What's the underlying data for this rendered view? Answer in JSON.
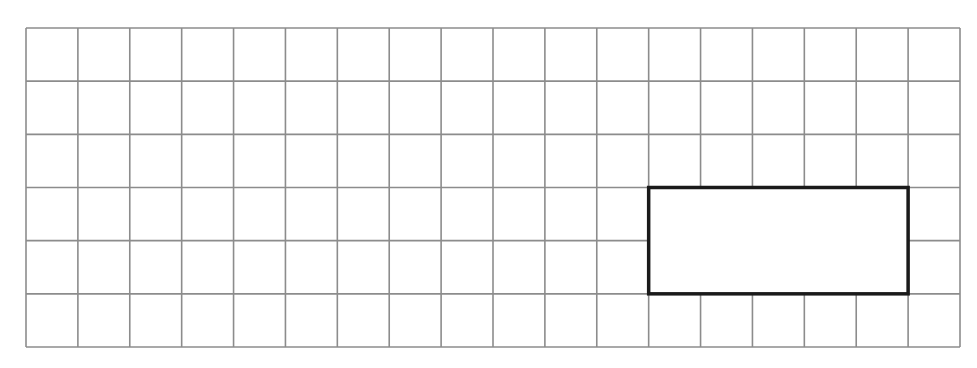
{
  "diagram": {
    "type": "grid-with-highlighted-rectangle",
    "grid": {
      "columns": 18,
      "rows": 6,
      "left": 26,
      "top": 28,
      "right": 960,
      "bottom": 347,
      "line_color": "#8c8c8c",
      "line_width": 1.6
    },
    "highlighted_rectangle": {
      "col_start": 12,
      "col_end": 17,
      "row_start": 3,
      "row_end": 5,
      "width_cells": 5,
      "height_cells": 2,
      "stroke_color": "#1a1a1a",
      "stroke_width": 3.5,
      "fill": "#ffffff"
    },
    "background": "#ffffff"
  }
}
